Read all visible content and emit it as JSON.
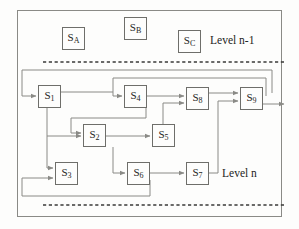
{
  "diagram": {
    "frame": {
      "x": 17,
      "y": 10,
      "w": 265,
      "h": 207,
      "border_color": "#8a8a86"
    },
    "colors": {
      "box_border": "#6e6e6a",
      "wire": "#8a8a86",
      "text": "#242422",
      "background": "#fdfdfc",
      "dotted_divider": "#3a3a38"
    },
    "labels": [
      {
        "name": "level-upper-label",
        "text": "Level n-1",
        "x": 210,
        "y": 34
      },
      {
        "name": "level-lower-label",
        "text": "Level n",
        "x": 222,
        "y": 167
      }
    ],
    "dividers": [
      {
        "name": "divider-upper",
        "x1": 43,
        "y": 62,
        "x2": 285
      },
      {
        "name": "divider-lower",
        "x1": 43,
        "y": 205,
        "x2": 285
      }
    ],
    "nodes": [
      {
        "id": "SA",
        "base": "S",
        "sub": "A",
        "x": 62,
        "y": 27,
        "w": 23,
        "h": 23,
        "level": "n-1"
      },
      {
        "id": "SB",
        "base": "S",
        "sub": "B",
        "x": 124,
        "y": 17,
        "w": 23,
        "h": 23,
        "level": "n-1"
      },
      {
        "id": "SC",
        "base": "S",
        "sub": "C",
        "x": 178,
        "y": 30,
        "w": 23,
        "h": 23,
        "level": "n-1"
      },
      {
        "id": "S1",
        "base": "S",
        "sub": "1",
        "x": 38,
        "y": 85,
        "w": 23,
        "h": 23,
        "level": "n"
      },
      {
        "id": "S4",
        "base": "S",
        "sub": "4",
        "x": 124,
        "y": 85,
        "w": 23,
        "h": 23,
        "level": "n"
      },
      {
        "id": "S8",
        "base": "S",
        "sub": "8",
        "x": 186,
        "y": 87,
        "w": 23,
        "h": 23,
        "level": "n"
      },
      {
        "id": "S9",
        "base": "S",
        "sub": "9",
        "x": 240,
        "y": 87,
        "w": 23,
        "h": 23,
        "level": "n"
      },
      {
        "id": "S2",
        "base": "S",
        "sub": "2",
        "x": 83,
        "y": 124,
        "w": 23,
        "h": 23,
        "level": "n"
      },
      {
        "id": "S5",
        "base": "S",
        "sub": "5",
        "x": 152,
        "y": 124,
        "w": 23,
        "h": 23,
        "level": "n"
      },
      {
        "id": "S3",
        "base": "S",
        "sub": "3",
        "x": 55,
        "y": 162,
        "w": 23,
        "h": 23,
        "level": "n"
      },
      {
        "id": "S6",
        "base": "S",
        "sub": "6",
        "x": 127,
        "y": 162,
        "w": 23,
        "h": 23,
        "level": "n"
      },
      {
        "id": "S7",
        "base": "S",
        "sub": "7",
        "x": 186,
        "y": 162,
        "w": 23,
        "h": 23,
        "level": "n"
      }
    ],
    "edges": [
      {
        "name": "edge-S1-to-S4",
        "from": "S1",
        "to": "S4"
      },
      {
        "name": "edge-S4-to-S8",
        "from": "S4",
        "to": "S8"
      },
      {
        "name": "edge-S8-to-S9",
        "from": "S8",
        "to": "S9"
      },
      {
        "name": "edge-S1-to-S2",
        "from": "S1",
        "to": "S2"
      },
      {
        "name": "edge-S2-to-S5",
        "from": "S2",
        "to": "S5"
      },
      {
        "name": "edge-S5-to-S8",
        "from": "S5",
        "to": "S8"
      },
      {
        "name": "edge-S1-to-S3",
        "from": "S1",
        "to": "S3"
      },
      {
        "name": "edge-S2-to-S6",
        "from": "S2",
        "to": "S6"
      },
      {
        "name": "edge-S6-to-S7",
        "from": "S6",
        "to": "S7"
      },
      {
        "name": "edge-S7-to-S9",
        "from": "S7",
        "to": "S9"
      },
      {
        "name": "edge-S4-feedback-S2",
        "from": "S4",
        "to": "S2"
      },
      {
        "name": "edge-S6-feedback-S3",
        "from": "S6",
        "to": "S3"
      },
      {
        "name": "edge-S9-feedback-S1",
        "from": "S9",
        "to": "S1"
      },
      {
        "name": "edge-S9-feedback-S4",
        "from": "S9",
        "to": "S4"
      },
      {
        "name": "edge-S9-output",
        "from": "S9",
        "to": "output"
      }
    ]
  }
}
